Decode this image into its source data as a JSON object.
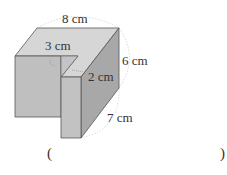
{
  "figure": {
    "type": "3D solid (cuboid with rectangular notch removed)",
    "colors": {
      "top_face": "#d4d4d4",
      "front_face": "#bdbdbd",
      "right_face": "#a6a6a6",
      "edge": "#555555",
      "dim_arc": "#bbbbbb"
    },
    "labels": {
      "width_top": "8 cm",
      "notch_width": "3 cm",
      "notch_depth": "2 cm",
      "depth_right": "6 cm",
      "height": "7 cm"
    }
  },
  "answer": {
    "open_paren": "(",
    "close_paren": ")",
    "value": ""
  }
}
